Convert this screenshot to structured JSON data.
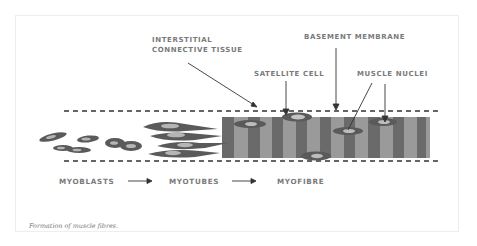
{
  "figure": {
    "caption": "Formation of muscle fibres.",
    "labels": {
      "interstitial_line1": "INTERSTITIAL",
      "interstitial_line2": "CONNECTIVE TISSUE",
      "basement_membrane": "BASEMENT MEMBRANE",
      "satellite_cell": "SATELLITE CELL",
      "muscle_nuclei": "MUSCLE NUCLEI"
    },
    "stages": [
      {
        "label": "MYOBLASTS"
      },
      {
        "label": "MYOTUBES"
      },
      {
        "label": "MYOFIBRE"
      }
    ],
    "colors": {
      "cell_dark": "#5a5a5a",
      "nucleus_light": "#a8a8a8",
      "stripe_dark": "#6a6a6a",
      "stripe_light": "#9a9a9a",
      "label_text": "#7a7a7a",
      "line": "#333333"
    }
  }
}
